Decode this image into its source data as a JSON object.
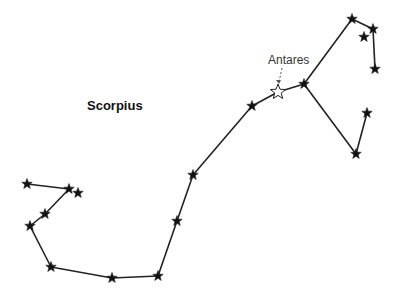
{
  "title": "Scorpius",
  "annotation": {
    "label": "Antares",
    "x": 290,
    "y": 60
  },
  "colors": {
    "line": "#222222",
    "star_fill": "#111111",
    "highlight_fill": "#ffffff"
  },
  "stars": [
    {
      "id": "s1",
      "x": 352,
      "y": 19
    },
    {
      "id": "s2",
      "x": 373,
      "y": 29
    },
    {
      "id": "s3",
      "x": 364,
      "y": 37
    },
    {
      "id": "s4",
      "x": 375,
      "y": 69
    },
    {
      "id": "antares",
      "x": 278,
      "y": 92,
      "name": "Antares",
      "highlight": true
    },
    {
      "id": "s6",
      "x": 304,
      "y": 84
    },
    {
      "id": "s7",
      "x": 252,
      "y": 106
    },
    {
      "id": "s8",
      "x": 367,
      "y": 113
    },
    {
      "id": "s9",
      "x": 356,
      "y": 154
    },
    {
      "id": "s10",
      "x": 193,
      "y": 175
    },
    {
      "id": "s11",
      "x": 177,
      "y": 221
    },
    {
      "id": "s12",
      "x": 158,
      "y": 276
    },
    {
      "id": "s13",
      "x": 112,
      "y": 278
    },
    {
      "id": "s14",
      "x": 51,
      "y": 267
    },
    {
      "id": "s15",
      "x": 30,
      "y": 226
    },
    {
      "id": "s16",
      "x": 45,
      "y": 214
    },
    {
      "id": "s17",
      "x": 69,
      "y": 189
    },
    {
      "id": "s18",
      "x": 78,
      "y": 193
    },
    {
      "id": "s19",
      "x": 27,
      "y": 184
    }
  ],
  "lines": [
    [
      "s4",
      "s2"
    ],
    [
      "s2",
      "s1"
    ],
    [
      "s1",
      "s6"
    ],
    [
      "s6",
      "antares"
    ],
    [
      "antares",
      "s7"
    ],
    [
      "s6",
      "s9"
    ],
    [
      "s9",
      "s8"
    ],
    [
      "s7",
      "s10"
    ],
    [
      "s10",
      "s11"
    ],
    [
      "s11",
      "s12"
    ],
    [
      "s12",
      "s13"
    ],
    [
      "s13",
      "s14"
    ],
    [
      "s14",
      "s15"
    ],
    [
      "s15",
      "s16"
    ],
    [
      "s16",
      "s17"
    ],
    [
      "s17",
      "s19"
    ]
  ]
}
